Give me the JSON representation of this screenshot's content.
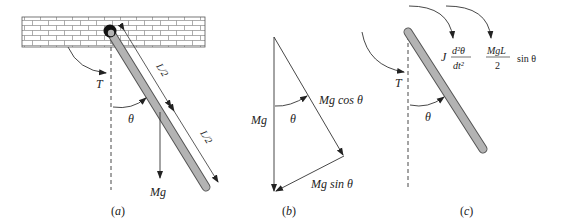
{
  "panels": [
    {
      "id": "a",
      "caption": "(a)",
      "labels": {
        "torque": "T",
        "angle": "θ",
        "weight": "Mg",
        "half_length_top": "L/2",
        "half_length_bottom": "L/2"
      }
    },
    {
      "id": "b",
      "caption": "(b)",
      "labels": {
        "weight": "Mg",
        "angle": "θ",
        "parallel_component": "Mg cos θ",
        "perpendicular_component": "Mg sin θ"
      }
    },
    {
      "id": "c",
      "caption": "(c)",
      "labels": {
        "torque": "T",
        "angle": "θ",
        "inertia_coef": "J",
        "inertia_num": "d²θ",
        "inertia_den": "dt²",
        "gravity_num": "MgL",
        "gravity_den": "2",
        "gravity_trig": "sin θ"
      }
    }
  ],
  "colors": {
    "rod_fill": "#b3b3b3",
    "rod_stroke": "#555555",
    "line": "#333333",
    "pivot": "#111111"
  }
}
